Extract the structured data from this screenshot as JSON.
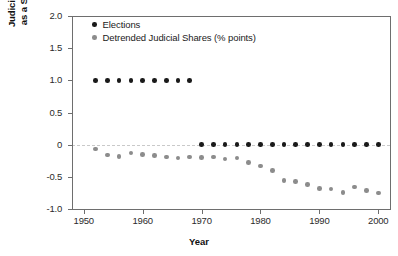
{
  "chart_data": {
    "type": "scatter",
    "title": "",
    "xlabel": "Year",
    "ylabel": "Judicial Expenditures as a Share of Budget",
    "ylabel_line1": "Judicial Expenditures",
    "ylabel_line2": "as a Share of Budget",
    "xlim": [
      1948,
      2002
    ],
    "ylim": [
      -1.0,
      2.0
    ],
    "xticks": [
      1950,
      1960,
      1970,
      1980,
      1990,
      2000
    ],
    "xtick_labels": [
      "1950",
      "1960",
      "1970",
      "1980",
      "1990",
      "2000"
    ],
    "yticks": [
      2.0,
      1.5,
      1.0,
      0.5,
      0,
      -0.5,
      -1.0
    ],
    "ytick_labels": [
      "2.0",
      "1.5",
      "1.0",
      "0.5",
      "0",
      "-0.5",
      "-1.0"
    ],
    "grid": false,
    "zero_reference_line": 0,
    "legend_position": "top-left",
    "colors": {
      "elections": "#1a1a1a",
      "shares": "#8c8c8c",
      "axis": "#6e6e6e",
      "zero_line": "#c9c9c9",
      "background": "#ffffff"
    },
    "series": [
      {
        "name": "Elections",
        "marker": "circle",
        "color": "#1a1a1a",
        "x": [
          1952,
          1954,
          1956,
          1958,
          1960,
          1962,
          1964,
          1966,
          1968,
          1970,
          1972,
          1974,
          1976,
          1978,
          1980,
          1982,
          1984,
          1986,
          1988,
          1990,
          1992,
          1994,
          1996,
          1998,
          2000
        ],
        "values": [
          1.0,
          1.0,
          1.0,
          1.0,
          1.0,
          1.0,
          1.0,
          1.0,
          1.0,
          0,
          0,
          0,
          0,
          0,
          0,
          0,
          0,
          0,
          0,
          0,
          0,
          0,
          0,
          0,
          0
        ]
      },
      {
        "name": "Detrended Judicial Shares (% points)",
        "marker": "circle",
        "color": "#8c8c8c",
        "x": [
          1952,
          1954,
          1956,
          1958,
          1960,
          1962,
          1964,
          1966,
          1968,
          1970,
          1972,
          1974,
          1976,
          1978,
          1980,
          1982,
          1984,
          1986,
          1988,
          1990,
          1992,
          1994,
          1996,
          1998,
          2000
        ],
        "values": [
          -0.07,
          -0.16,
          -0.18,
          -0.13,
          -0.15,
          -0.17,
          -0.19,
          -0.21,
          -0.19,
          -0.2,
          -0.19,
          -0.22,
          -0.21,
          -0.28,
          -0.33,
          -0.4,
          -0.56,
          -0.57,
          -0.62,
          -0.68,
          -0.69,
          -0.74,
          -0.66,
          -0.71,
          -0.75
        ]
      }
    ]
  },
  "legend": {
    "items": [
      {
        "label": "Elections",
        "key": "elections"
      },
      {
        "label": "Detrended Judicial Shares (% points)",
        "key": "shares"
      }
    ]
  }
}
